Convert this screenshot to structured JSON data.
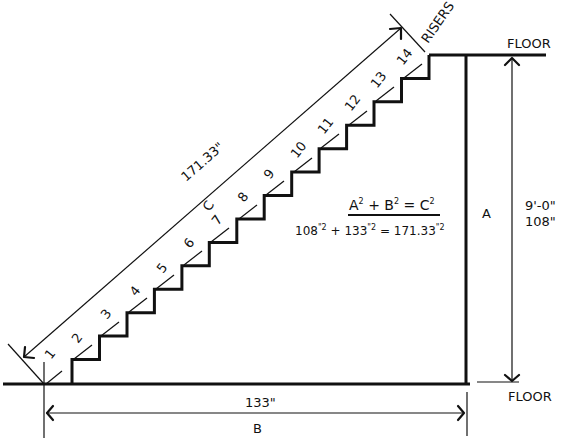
{
  "diagram": {
    "labels": {
      "floor_top": "FLOOR",
      "floor_bottom": "FLOOR",
      "risers": "RISERS",
      "rise_letter": "A",
      "rise_feet": "9'-0\"",
      "rise_inches": "108\"",
      "run_value": "133\"",
      "run_letter": "B",
      "diagonal_value": "171.33\"",
      "diagonal_letter": "C"
    },
    "formula": {
      "a": "A",
      "b": "B",
      "c": "C",
      "exp": "2",
      "plus": "+",
      "equals": "=",
      "calc_a": "108",
      "calc_b": "133",
      "calc_c": "171.33",
      "calc_exp": "\"2"
    },
    "riser_numbers": [
      "1",
      "2",
      "3",
      "4",
      "5",
      "6",
      "7",
      "8",
      "9",
      "10",
      "11",
      "12",
      "13",
      "14"
    ],
    "dimensions": {
      "rise_in": 108,
      "run_in": 133,
      "diagonal_in": 171.33,
      "riser_count": 14
    },
    "colors": {
      "line": "#111111",
      "background": "#ffffff"
    }
  }
}
